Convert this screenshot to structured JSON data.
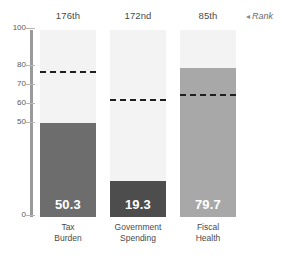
{
  "chart_data": {
    "type": "bar",
    "title": "",
    "xlabel": "",
    "ylabel": "",
    "ylim": [
      0,
      100
    ],
    "grid": false,
    "categories": [
      "Tax Burden",
      "Government Spending",
      "Fiscal Health"
    ],
    "values": [
      50.3,
      19.3,
      79.7
    ],
    "value_labels": [
      "50.3",
      "19.3",
      "79.7"
    ],
    "ytick_labels": [
      "100",
      "80",
      "70",
      "60",
      "50",
      "0"
    ],
    "ytick_values": [
      100,
      80,
      70,
      60,
      50,
      0
    ],
    "series": [
      {
        "name": "Score",
        "values": [
          50.3,
          19.3,
          79.7
        ]
      },
      {
        "name": "Reference",
        "values": [
          78,
          63,
          66
        ]
      }
    ],
    "reference_line_values": [
      78,
      63,
      66
    ],
    "annotations": {
      "rank_legend": "Rank",
      "rank_legend_marker": "◂",
      "ranks": [
        "176th",
        "172nd",
        "85th"
      ]
    },
    "colors": {
      "bar_tax_burden": "#6d6d6d",
      "bar_government_spending": "#4d4d4d",
      "bar_fiscal_health": "#a8a8a8",
      "track": "#f3f3f3",
      "reference_line": "#1f1f1f",
      "axis": "#9a9a9a",
      "value_label": "#ffffff",
      "text": "#4a4a4a",
      "background": "#ffffff"
    }
  },
  "columns": [
    {
      "rank": "176th",
      "category_line1": "Tax",
      "category_line2": "Burden",
      "value_label": "50.3",
      "value": 50.3,
      "reference": 78,
      "color": "#6d6d6d"
    },
    {
      "rank": "172nd",
      "category_line1": "Government",
      "category_line2": "Spending",
      "value_label": "19.3",
      "value": 19.3,
      "reference": 63,
      "color": "#4d4d4d"
    },
    {
      "rank": "85th",
      "category_line1": "Fiscal",
      "category_line2": "Health",
      "value_label": "79.7",
      "value": 79.7,
      "reference": 66,
      "color": "#a8a8a8"
    }
  ],
  "axis": {
    "ticks": [
      {
        "label": "100",
        "value": 100
      },
      {
        "label": "80",
        "value": 80
      },
      {
        "label": "70",
        "value": 70
      },
      {
        "label": "60",
        "value": 60
      },
      {
        "label": "50",
        "value": 50
      },
      {
        "label": "0",
        "value": 0
      }
    ]
  },
  "legend": {
    "rank_marker": "◂",
    "rank_text": "Rank"
  }
}
